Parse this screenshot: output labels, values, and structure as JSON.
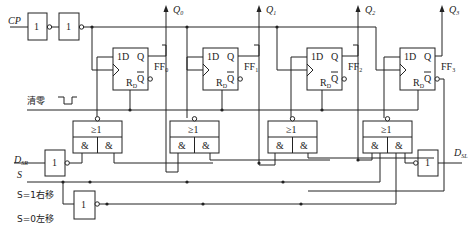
{
  "inputs": {
    "clock": "CP",
    "clear": "清零",
    "serial_right": {
      "main": "D",
      "sub": "SR"
    },
    "serial_left": {
      "main": "D",
      "sub": "SL"
    },
    "select": "S",
    "mode_right": "S=1右移",
    "mode_left": "S=0左移"
  },
  "gate_labels": {
    "not": "1",
    "or": "≥1",
    "and": "&"
  },
  "flip_flops": [
    {
      "name": "FF",
      "index": "0",
      "d_pin": "1D",
      "q_pin": "Q",
      "qbar_pin": "Q",
      "reset_pin": "R",
      "reset_sub": "D",
      "output": "Q",
      "output_sub": "0"
    },
    {
      "name": "FF",
      "index": "1",
      "d_pin": "1D",
      "q_pin": "Q",
      "qbar_pin": "Q",
      "reset_pin": "R",
      "reset_sub": "D",
      "output": "Q",
      "output_sub": "1"
    },
    {
      "name": "FF",
      "index": "2",
      "d_pin": "1D",
      "q_pin": "Q",
      "qbar_pin": "Q",
      "reset_pin": "R",
      "reset_sub": "D",
      "output": "Q",
      "output_sub": "2"
    },
    {
      "name": "FF",
      "index": "3",
      "d_pin": "1D",
      "q_pin": "Q",
      "qbar_pin": "Q",
      "reset_pin": "R",
      "reset_sub": "D",
      "output": "Q",
      "output_sub": "3"
    }
  ]
}
